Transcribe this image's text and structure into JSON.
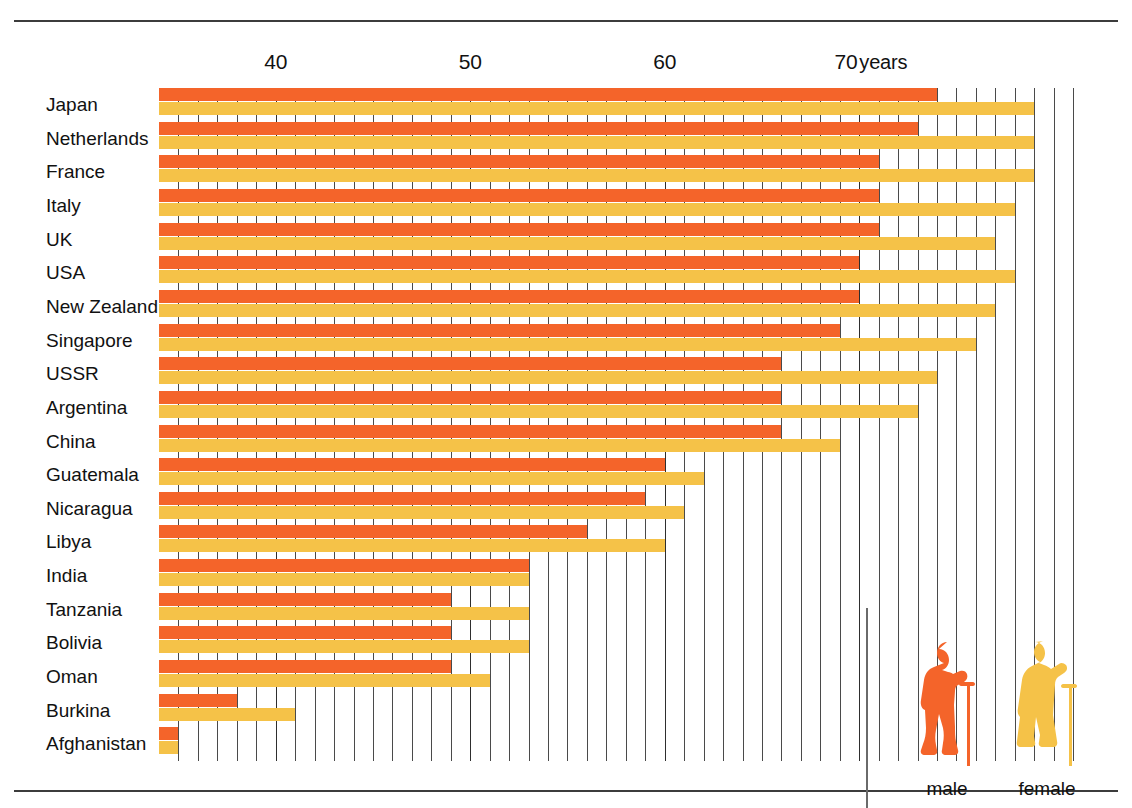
{
  "chart_data": {
    "type": "bar",
    "orientation": "horizontal",
    "title": "",
    "xlabel": "years",
    "ylabel": "",
    "xlim": [
      34,
      82
    ],
    "grid": true,
    "grid_interval": 1,
    "tick_labels": [
      {
        "value": 40,
        "text": "40"
      },
      {
        "value": 50,
        "text": "50"
      },
      {
        "value": 60,
        "text": "60"
      },
      {
        "value": 70,
        "text": "70",
        "unit": "years"
      }
    ],
    "legend": {
      "position": "bottom-right",
      "entries": [
        {
          "name": "male",
          "color": "#f4642a",
          "icon": "elderly-man-with-cane-icon"
        },
        {
          "name": "female",
          "color": "#f5c248",
          "icon": "elderly-woman-with-cane-icon"
        }
      ]
    },
    "categories": [
      "Japan",
      "Netherlands",
      "France",
      "Italy",
      "UK",
      "USA",
      "New Zealand",
      "Singapore",
      "USSR",
      "Argentina",
      "China",
      "Guatemala",
      "Nicaragua",
      "Libya",
      "India",
      "Tanzania",
      "Bolivia",
      "Oman",
      "Burkina",
      "Afghanistan"
    ],
    "series": [
      {
        "name": "male",
        "color": "#f4642a",
        "values": [
          74,
          73,
          71,
          71,
          71,
          70,
          70,
          69,
          66,
          66,
          66,
          60,
          59,
          56,
          53,
          49,
          49,
          49,
          38,
          35
        ]
      },
      {
        "name": "female",
        "color": "#f5c248",
        "values": [
          79,
          79,
          79,
          78,
          77,
          78,
          77,
          76,
          74,
          73,
          69,
          62,
          61,
          60,
          53,
          53,
          53,
          51,
          41,
          35
        ]
      }
    ]
  },
  "legend": {
    "male_label": "male",
    "female_label": "female"
  }
}
